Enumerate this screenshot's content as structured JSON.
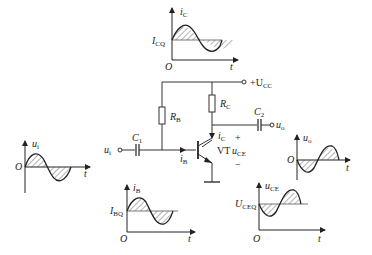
{
  "circuit": {
    "supply": {
      "plus": "+",
      "name": "U",
      "sub": "CC"
    },
    "rb": {
      "name": "R",
      "sub": "B"
    },
    "rc": {
      "name": "R",
      "sub": "C"
    },
    "c1": {
      "name": "C",
      "sub": "1"
    },
    "c2": {
      "name": "C",
      "sub": "2"
    },
    "vt": "VT",
    "ui": {
      "name": "u",
      "sub": "i"
    },
    "uo": {
      "name": "u",
      "sub": "o"
    },
    "ib": {
      "name": "i",
      "sub": "B"
    },
    "ic": {
      "name": "i",
      "sub": "C"
    },
    "uce": {
      "name": "u",
      "sub": "CE"
    },
    "plus": "+",
    "minus": "−"
  },
  "graphs": {
    "ic": {
      "ylabel": "i",
      "ysub": "C",
      "level": "I",
      "levelsub": "CQ",
      "origin": "O",
      "xlabel": "t"
    },
    "ui": {
      "ylabel": "u",
      "ysub": "i",
      "origin": "O",
      "xlabel": "t"
    },
    "ib": {
      "ylabel": "i",
      "ysub": "B",
      "level": "I",
      "levelsub": "BQ",
      "origin": "O",
      "xlabel": "t"
    },
    "uo": {
      "ylabel": "u",
      "ysub": "o",
      "origin": "O",
      "xlabel": "t"
    },
    "uce": {
      "ylabel": "u",
      "ysub": "CE",
      "level": "U",
      "levelsub": "CEQ",
      "origin": "O",
      "xlabel": "t"
    }
  }
}
